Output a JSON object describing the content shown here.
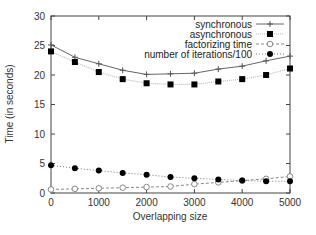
{
  "chart_data": {
    "type": "line",
    "title": "",
    "xlabel": "Overlapping size",
    "ylabel": "Time (in seconds)",
    "xlim": [
      0,
      5000
    ],
    "ylim": [
      0,
      30
    ],
    "xticks": [
      0,
      1000,
      2000,
      3000,
      4000,
      5000
    ],
    "yticks": [
      0,
      5,
      10,
      15,
      20,
      25,
      30
    ],
    "grid": false,
    "legend_position": "top-right",
    "x": [
      0,
      500,
      1000,
      1500,
      2000,
      2500,
      3000,
      3500,
      4000,
      4500,
      5000
    ],
    "series": [
      {
        "name": "synchronous",
        "style": "solid line with plus markers",
        "color": "#555555",
        "values": [
          25.1,
          23.0,
          21.9,
          20.8,
          20.1,
          20.2,
          20.3,
          21.0,
          21.5,
          22.4,
          23.2
        ]
      },
      {
        "name": "asynchronous",
        "style": "light dotted line with filled square markers",
        "color": "#000000",
        "values": [
          24.0,
          22.2,
          20.5,
          19.3,
          18.6,
          18.4,
          18.4,
          18.9,
          19.3,
          20.0,
          21.1
        ]
      },
      {
        "name": "factorizing time",
        "style": "dashed line with open circle markers",
        "color": "#888888",
        "values": [
          0.6,
          0.7,
          0.8,
          0.9,
          1.0,
          1.1,
          1.5,
          1.8,
          2.1,
          2.4,
          2.8
        ]
      },
      {
        "name": "number of iterations/100",
        "style": "dotted line with filled circle markers",
        "color": "#000000",
        "values": [
          4.7,
          4.2,
          3.8,
          3.4,
          3.1,
          2.7,
          2.5,
          2.3,
          2.1,
          2.0,
          2.0
        ]
      }
    ]
  }
}
